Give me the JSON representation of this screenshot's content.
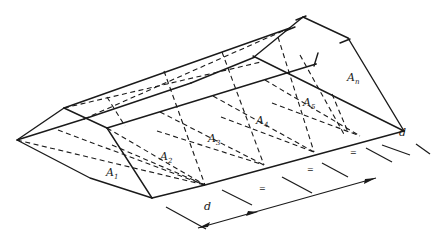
{
  "diagram": {
    "type": "isometric prismatoid earthwork volume sketch",
    "areas": [
      {
        "id": "a1",
        "base": "A",
        "sub": "1",
        "x": 106,
        "y": 176
      },
      {
        "id": "a2",
        "base": "A",
        "sub": "2",
        "x": 160,
        "y": 160
      },
      {
        "id": "a3",
        "base": "A",
        "sub": "3",
        "x": 208,
        "y": 142
      },
      {
        "id": "a4",
        "base": "A",
        "sub": "4",
        "x": 256,
        "y": 124
      },
      {
        "id": "a5",
        "base": "A",
        "sub": "5",
        "x": 303,
        "y": 106
      },
      {
        "id": "an",
        "base": "A",
        "sub": "n",
        "x": 347,
        "y": 81
      }
    ],
    "dimension_labels": [
      {
        "id": "d-left",
        "text": "d",
        "x": 204,
        "y": 210
      },
      {
        "id": "d-right",
        "text": "d",
        "x": 399,
        "y": 136
      }
    ],
    "equal_marks": [
      {
        "text": "=",
        "x": 259,
        "y": 191
      },
      {
        "text": "=",
        "x": 307,
        "y": 172
      },
      {
        "text": "=",
        "x": 350,
        "y": 155
      }
    ]
  }
}
